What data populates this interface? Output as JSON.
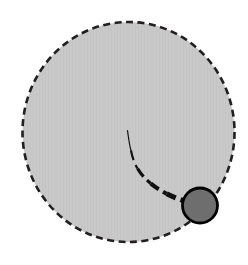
{
  "canvas": {
    "width": 248,
    "height": 265,
    "background_color": "#ffffff",
    "title": "Dashed region with marker and tapered path"
  },
  "colors": {
    "region_fill": "#c9c9c9",
    "region_stroke": "#231f20",
    "path_stroke": "#111111",
    "marker_fill": "#6e6e6e",
    "marker_stroke": "#000000",
    "background": "#ffffff"
  },
  "shapes": {
    "region": {
      "name": "dashed-region",
      "type": "ellipse",
      "cx": 128.5,
      "cy": 132,
      "rx": 106,
      "ry": 110,
      "fill": "#c9c9c9",
      "stroke": "#231f20",
      "stroke_width": 2.6,
      "dash_pattern": "7 4.5"
    },
    "path": {
      "name": "tapered-dashed-path",
      "type": "curve",
      "points": [
        [
          127.5,
          130.5
        ],
        [
          131.0,
          150.0
        ],
        [
          138.0,
          168.0
        ],
        [
          150.5,
          183.5
        ],
        [
          166.0,
          194.0
        ],
        [
          183.0,
          200.5
        ]
      ],
      "stroke": "#111111",
      "dash_pattern": "10 5",
      "start_width": 1.2,
      "end_width": 5.0
    },
    "marker": {
      "name": "marker-circle",
      "type": "circle",
      "cx": 200,
      "cy": 205.5,
      "r": 17.5,
      "fill": "#6e6e6e",
      "stroke": "#000000",
      "stroke_width": 2.8
    }
  },
  "labels": {
    "region": "Region",
    "path": "Path",
    "marker": "Marker"
  }
}
